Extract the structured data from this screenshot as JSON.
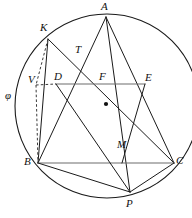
{
  "figure": {
    "canvas": {
      "width": 192,
      "height": 218,
      "background": "#ffffff"
    },
    "colors": {
      "stroke": "#1a1a1a",
      "gray_stroke": "#6d6d6d",
      "dashed_stroke": "#3a3a3a",
      "label": "#111111",
      "background": "#ffffff"
    }
  },
  "circle": {
    "name": "phi",
    "label": "φ",
    "label_x": 5,
    "label_y": 90,
    "center": {
      "x": 107,
      "y": 106
    },
    "radius": 92
  },
  "center_marker": {
    "x": 106,
    "y": 104,
    "radius": 2.1
  },
  "points": [
    {
      "id": "A",
      "label": "A",
      "x": 106,
      "y": 17,
      "label_x": 101,
      "label_y": 1,
      "on_circle": true
    },
    {
      "id": "K",
      "label": "K",
      "x": 48,
      "y": 39,
      "label_x": 40,
      "label_y": 22,
      "on_circle": true
    },
    {
      "id": "T",
      "label": "T",
      "x": 78,
      "y": 58,
      "label_x": 75,
      "label_y": 44,
      "on_circle": false
    },
    {
      "id": "V",
      "label": "V",
      "x": 36,
      "y": 85,
      "label_x": 28,
      "label_y": 74,
      "on_circle": false
    },
    {
      "id": "D",
      "label": "D",
      "x": 56,
      "y": 84,
      "label_x": 54,
      "label_y": 71,
      "on_circle": false
    },
    {
      "id": "F",
      "label": "F",
      "x": 104,
      "y": 84,
      "label_x": 99,
      "label_y": 71,
      "on_circle": false
    },
    {
      "id": "E",
      "label": "E",
      "x": 145,
      "y": 84,
      "label_x": 145,
      "label_y": 72,
      "on_circle": true
    },
    {
      "id": "B",
      "label": "B",
      "x": 38,
      "y": 163,
      "label_x": 24,
      "label_y": 156,
      "on_circle": true
    },
    {
      "id": "M",
      "label": "M",
      "x": 122,
      "y": 163,
      "label_x": 117,
      "label_y": 139,
      "on_circle": false
    },
    {
      "id": "C",
      "label": "C",
      "x": 174,
      "y": 163,
      "label_x": 176,
      "label_y": 155,
      "on_circle": true
    },
    {
      "id": "P",
      "label": "P",
      "x": 130,
      "y": 192,
      "label_x": 126,
      "label_y": 198,
      "on_circle": true
    }
  ],
  "segments": [
    {
      "name": "segment-A-B",
      "from": "A",
      "to": "B",
      "style": "solid"
    },
    {
      "name": "segment-A-C",
      "from": "A",
      "to": "C",
      "style": "solid"
    },
    {
      "name": "segment-A-P",
      "from": "A",
      "to": "P",
      "style": "solid"
    },
    {
      "name": "segment-K-B",
      "from": "K",
      "to": "B",
      "style": "solid"
    },
    {
      "name": "segment-K-C",
      "from": "K",
      "to": "C",
      "style": "solid"
    },
    {
      "name": "segment-K-V",
      "from": "K",
      "to": "V",
      "style": "dashed"
    },
    {
      "name": "segment-V-B",
      "from": "V",
      "to": "B",
      "style": "dashed"
    },
    {
      "name": "segment-V-D",
      "from": "V",
      "to": "D",
      "style": "dashed"
    },
    {
      "name": "segment-D-E",
      "from": "D",
      "to": "E",
      "style": "gray"
    },
    {
      "name": "segment-B-C",
      "from": "B",
      "to": "C",
      "style": "gray"
    },
    {
      "name": "segment-B-P",
      "from": "B",
      "to": "P",
      "style": "solid"
    },
    {
      "name": "segment-C-P",
      "from": "C",
      "to": "P",
      "style": "solid"
    },
    {
      "name": "segment-D-P",
      "from": "D",
      "to": "P",
      "style": "solid"
    },
    {
      "name": "segment-E-M",
      "from": "E",
      "to": "M",
      "style": "solid"
    }
  ]
}
